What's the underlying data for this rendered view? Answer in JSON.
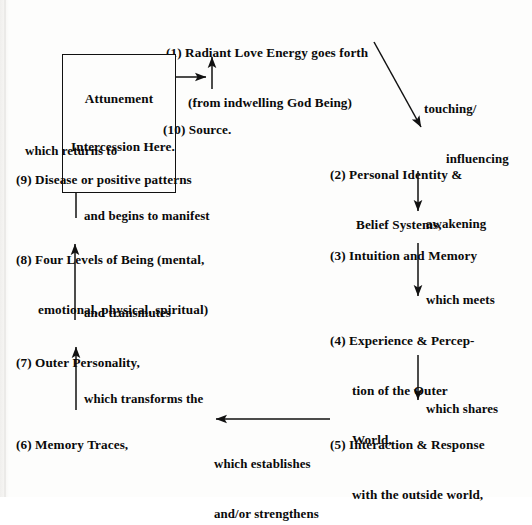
{
  "diagram": {
    "background_color": "#fdfdfc",
    "ink_color": "#0a0a0a",
    "nodes": [
      {
        "id": "node-1",
        "number": "(1)",
        "line1": "(1) Radiant Love Energy goes forth",
        "line2": "(from indwelling God Being)"
      },
      {
        "id": "node-2",
        "number": "(2)",
        "line1": "(2) Personal Identity &",
        "line2": "Belief Systems,"
      },
      {
        "id": "node-3",
        "number": "(3)",
        "line1": "(3) Intuition and Memory"
      },
      {
        "id": "node-4",
        "number": "(4)",
        "line1": "(4) Experience & Percep-",
        "line2": "tion of the Outer",
        "line3": "World,"
      },
      {
        "id": "node-5",
        "number": "(5)",
        "line1": "(5) Interaction & Response",
        "line2": "with the outside world,"
      },
      {
        "id": "node-6",
        "number": "(6)",
        "line1": "(6) Memory Traces,"
      },
      {
        "id": "node-7",
        "number": "(7)",
        "line1": "(7) Outer Personality,"
      },
      {
        "id": "node-8",
        "number": "(8)",
        "line1": "(8) Four Levels of Being (mental,",
        "line2": "emotional, physical, spiritual)"
      },
      {
        "id": "node-9",
        "number": "(9)",
        "line1": "(9) Disease or positive patterns"
      },
      {
        "id": "node-10",
        "number": "(10)",
        "line1": "(10) Source."
      }
    ],
    "box": {
      "id": "attunement-box",
      "line1": "Attunement",
      "line2": "Intercession Here."
    },
    "edge_labels": [
      {
        "id": "edge-1-2",
        "line1": "touching/",
        "line2": "influencing"
      },
      {
        "id": "edge-2-3",
        "line1": "awakening"
      },
      {
        "id": "edge-3-4",
        "line1": "which meets"
      },
      {
        "id": "edge-4-5",
        "line1": "which shares"
      },
      {
        "id": "edge-5-6",
        "line1": "which establishes",
        "line2": "and/or strengthens"
      },
      {
        "id": "edge-6-7",
        "line1": "which transforms the"
      },
      {
        "id": "edge-7-8",
        "line1": "and transmutes"
      },
      {
        "id": "edge-8-9",
        "line1": "and begins to manifest"
      },
      {
        "id": "edge-9-10",
        "line1": "which returns to"
      }
    ]
  }
}
